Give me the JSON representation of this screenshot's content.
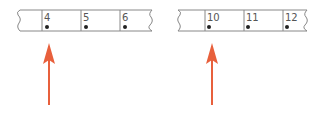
{
  "strips": [
    {
      "cells": [
        {
          "label": "4",
          "dot": true
        },
        {
          "label": "5",
          "dot": true
        },
        {
          "label": "6",
          "dot": true
        }
      ],
      "arrow_points_to": "4"
    },
    {
      "cells": [
        {
          "label": "10",
          "dot": true
        },
        {
          "label": "11",
          "dot": true
        },
        {
          "label": "12",
          "dot": true
        }
      ],
      "arrow_points_to": "10"
    }
  ],
  "colors": {
    "line": "#888888",
    "text": "#555555",
    "dot": "#222222",
    "arrow": "#e8603c"
  }
}
